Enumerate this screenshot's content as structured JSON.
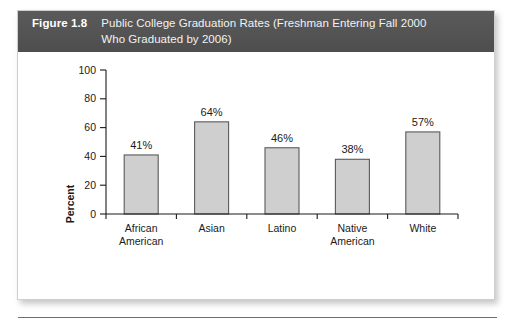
{
  "figure": {
    "number": "Figure 1.8",
    "title_line1": "Public College Graduation Rates (Freshman Entering Fall 2000",
    "title_line2": "Who Graduated by 2006)",
    "header_bg": "#545454",
    "header_text_color": "#ffffff"
  },
  "chart_data": {
    "type": "bar",
    "title": "Public College Graduation Rates (Freshman Entering Fall 2000 Who Graduated by 2006)",
    "categories": [
      "African American",
      "Asian",
      "Latino",
      "Native American",
      "White"
    ],
    "category_lines": [
      [
        "African",
        "American"
      ],
      [
        "Asian",
        ""
      ],
      [
        "Latino",
        ""
      ],
      [
        "Native",
        "American"
      ],
      [
        "White",
        ""
      ]
    ],
    "values": [
      41,
      64,
      46,
      38,
      57
    ],
    "data_labels": [
      "41%",
      "64%",
      "46%",
      "38%",
      "57%"
    ],
    "xlabel": "",
    "ylabel": "Percent",
    "ylim": [
      0,
      100
    ],
    "yticks": [
      0,
      20,
      40,
      60,
      80,
      100
    ],
    "ytick_labels": [
      "0",
      "20",
      "40",
      "60",
      "80",
      "100"
    ],
    "grid": false,
    "legend": false,
    "bar_fill": "#cfcfcf",
    "bar_stroke": "#5a5a5a"
  }
}
